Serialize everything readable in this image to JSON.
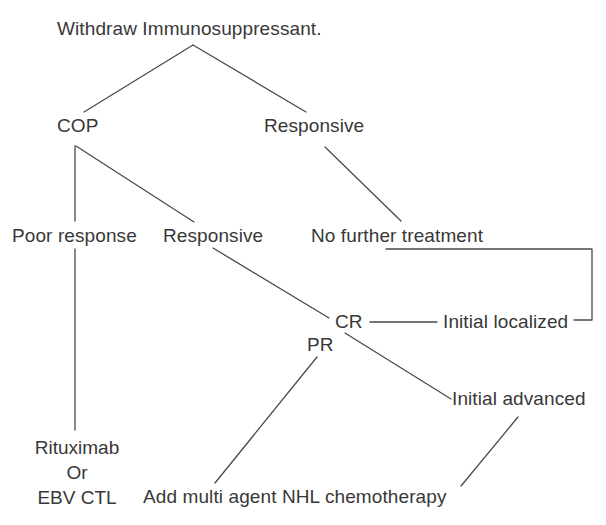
{
  "diagram": {
    "title": "Withdraw Immunosuppressant.",
    "type": "clinical-treatment-flowchart",
    "stroke_color": "#4a4a4a",
    "text_color": "#383838",
    "background_color": "#ffffff",
    "nodes": [
      {
        "id": "root",
        "label": "Withdraw Immunosuppressant.",
        "x": 57,
        "y": 18
      },
      {
        "id": "cop",
        "label": "COP",
        "x": 57,
        "y": 115
      },
      {
        "id": "responsive-top",
        "label": "Responsive",
        "x": 264,
        "y": 115
      },
      {
        "id": "poor-response",
        "label": "Poor response",
        "x": 12,
        "y": 225
      },
      {
        "id": "responsive-mid",
        "label": "Responsive",
        "x": 163,
        "y": 225
      },
      {
        "id": "no-further",
        "label": "No further treatment",
        "x": 311,
        "y": 225
      },
      {
        "id": "cr",
        "label": "CR",
        "x": 335,
        "y": 311
      },
      {
        "id": "initial-localized",
        "label": "Initial localized",
        "x": 443,
        "y": 311
      },
      {
        "id": "pr",
        "label": "PR",
        "x": 307,
        "y": 334
      },
      {
        "id": "initial-advanced",
        "label": "Initial advanced",
        "x": 452,
        "y": 388
      },
      {
        "id": "nhl-chemo",
        "label": "Add multi agent NHL chemotherapy",
        "x": 143,
        "y": 486
      }
    ],
    "stacked_nodes": [
      {
        "id": "rituximab-ebvctl",
        "x": 22,
        "y": 435,
        "width": 110,
        "lines": [
          "Rituximab",
          "Or",
          "EBV CTL"
        ]
      }
    ],
    "edges": [
      {
        "id": "root-to-cop",
        "from": "root",
        "to": "cop",
        "points": "193,45 84,112"
      },
      {
        "id": "root-to-responsive-top",
        "from": "root",
        "to": "responsive-top",
        "points": "193,45 306,112"
      },
      {
        "id": "cop-to-poor-response",
        "from": "cop",
        "to": "poor-response",
        "points": "75,146 75,221"
      },
      {
        "id": "cop-to-responsive-mid",
        "from": "cop",
        "to": "responsive-mid",
        "points": "76,146 194,222"
      },
      {
        "id": "responsive-top-to-nft",
        "from": "responsive-top",
        "to": "no-further",
        "points": "325,147 401,221"
      },
      {
        "id": "responsive-mid-to-cr",
        "from": "responsive-mid",
        "to": "cr",
        "points": "213,248 329,318"
      },
      {
        "id": "cr-to-initial-localized",
        "from": "cr",
        "to": "initial-localized",
        "points": "370,322 437,322"
      },
      {
        "id": "nft-bracket",
        "from": "no-further",
        "to": "initial-localized",
        "points": "386,249 592,249 592,320 574,320"
      },
      {
        "id": "cr-to-initial-advanced",
        "from": "cr",
        "to": "initial-advanced",
        "points": "345,333 451,399"
      },
      {
        "id": "pr-to-nhl-chemo",
        "from": "pr",
        "to": "nhl-chemo",
        "points": "317,357 215,483"
      },
      {
        "id": "poor-response-to-ritux",
        "from": "poor-response",
        "to": "rituximab-ebvctl",
        "points": "75,249 75,430"
      },
      {
        "id": "initial-advanced-to-nhl",
        "from": "initial-advanced",
        "to": "nhl-chemo",
        "points": "518,417 461,486"
      }
    ]
  }
}
